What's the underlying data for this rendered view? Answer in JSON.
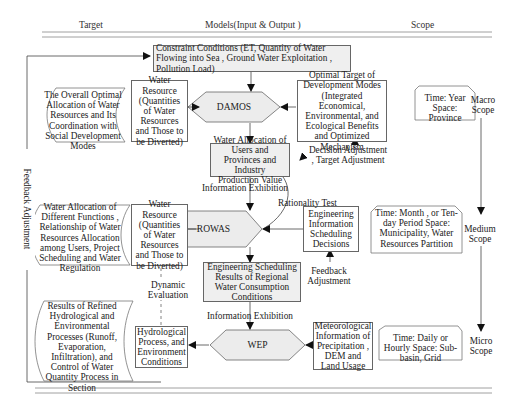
{
  "header": {
    "target": "Target",
    "models": "Models(Input & Output )",
    "scope": "Scope"
  },
  "constraint": "Constraint Conditions (ET, Quantity of Water Flowing into Sea , Ground Water Exploitation , Pollution Load)",
  "models": {
    "damos": "DAMOS",
    "rowas": "ROWAS",
    "wep": "WEP"
  },
  "targets": {
    "macro": "The Overall Optimal Allocation of Water Resources and Its Coordination with Social Development Modes",
    "medium": "Water Allocation of Different Functions , Relationship of Water Resources Allocation among Users, Project Scheduling and Water Regulation",
    "micro": "Results of Refined Hydrological and Environmental Processes (Runoff, Evaporation, Infiltration), and Control of Water Quantity Process in Section"
  },
  "outputs": {
    "damos_out": "Water Resource (Quantities of Water Resources and Those to be Diverted)",
    "rowas_out": "Water Resource (Quantities of Water Resources and Those to be Diverted)",
    "wep_out": "Hydrological Process, and Environment Conditions",
    "water_allocation": "Water Allocation of Users and Provinces and Industry Production Value",
    "engineering_results": "Engineering Scheduling Results of Regional Water Consumption Conditions"
  },
  "inputs": {
    "optimal_target": "Optimal Target of Development Modes (Integrated Economical, Environmental, and Ecological Benefits and Optimized Mechanism",
    "engineering_info": "Engineering Information Scheduling Decisions",
    "meteorological": "Meteorological Information of Precipitation , DEM and Land Usage"
  },
  "scopes": {
    "macro_detail": "Time: Year Space: Province",
    "medium_detail": "Time: Month , or Ten-day Period Space: Municipality, Water Resources Partition",
    "micro_detail": "Time: Daily or Hourly Space: Sub-basin, Grid",
    "macro_label": "Macro Scope",
    "medium_label": "Medium Scope",
    "micro_label": "Micro Scope"
  },
  "annotations": {
    "decision_adjustment": "Decision Adjustment , Target Adjustment",
    "info_exhibition_1": "Information  Exhibition",
    "info_exhibition_2": "Information Exhibition",
    "rationality_test": "Rationality Test",
    "feedback_adjustment": "Feedback Adjustment",
    "dynamic_evaluation": "Dynamic Evaluation",
    "feedback_side": "Feedback Adjustment"
  }
}
